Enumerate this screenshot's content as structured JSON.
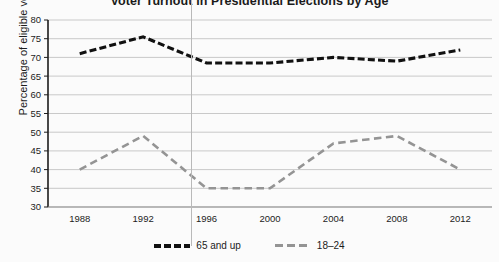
{
  "chart_data": {
    "type": "line",
    "title": "Voter Turnout in Presidential Elections by Age",
    "xlabel": "",
    "ylabel": "Percentage of eligible voters",
    "categories": [
      "1988",
      "1992",
      "1996",
      "2000",
      "2004",
      "2008",
      "2012"
    ],
    "x": [
      1988,
      1992,
      1996,
      2000,
      2004,
      2008,
      2012
    ],
    "series": [
      {
        "name": "65 and up",
        "color": "#111111",
        "style": "dashed",
        "values": [
          71,
          75.5,
          68.5,
          68.5,
          70,
          69,
          72
        ]
      },
      {
        "name": "18–24",
        "color": "#949494",
        "style": "dashed",
        "values": [
          40,
          49,
          35,
          35,
          47,
          49,
          40
        ]
      }
    ],
    "ylim": [
      30,
      80
    ],
    "ytick_step": 5,
    "yticks": [
      "80",
      "75",
      "70",
      "65",
      "60",
      "55",
      "50",
      "45",
      "40",
      "35",
      "30"
    ],
    "grid": true,
    "grid_axis": "y",
    "legend_position": "bottom"
  },
  "legend": {
    "entries": [
      {
        "label": "65 and up"
      },
      {
        "label": "18–24"
      }
    ]
  },
  "colors": {
    "series_old": "#111111",
    "series_young": "#949494",
    "grid": "#c9c9c9",
    "axis": "#1c1c1c",
    "background": "#fbfbfb"
  }
}
